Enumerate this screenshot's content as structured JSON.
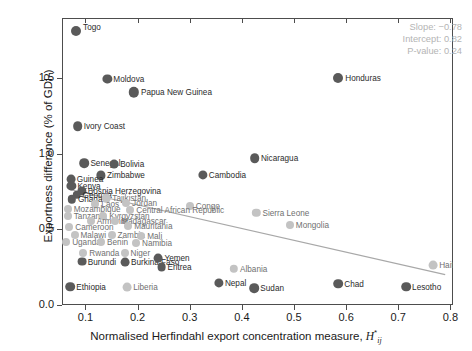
{
  "chart_data": {
    "type": "scatter",
    "title": "",
    "xlabel": "Normalised Herfindahl export concentration measure, H*ij",
    "ylabel": "Exportness difference (% of GDP)",
    "xlim": [
      0.055,
      0.805
    ],
    "ylim": [
      0.0,
      1.9
    ],
    "xticks": [
      "0.1",
      "0.2",
      "0.3",
      "0.4",
      "0.5",
      "0.6",
      "0.7",
      "0.8"
    ],
    "xtick_values": [
      0.1,
      0.2,
      0.3,
      0.4,
      0.5,
      0.6,
      0.7,
      0.8
    ],
    "yticks": [
      "0.0",
      "0.5",
      "1.0",
      "1.5"
    ],
    "ytick_values": [
      0.0,
      0.5,
      1.0,
      1.5
    ],
    "grid": false,
    "legend": "none",
    "annotations": {
      "slope_label": "Slope: −0.78",
      "intercept_label": "Intercept: 0.82",
      "pvalue_label": "P-value: 0.24",
      "slope": -0.78,
      "intercept": 0.82,
      "p_value": 0.24
    },
    "regression_line": {
      "x": [
        0.07,
        0.79
      ],
      "y": [
        0.765,
        0.201
      ],
      "color": "#a8a8a8"
    },
    "marker_colors": {
      "dark": "#5a5a5a",
      "light": "#c3c3c3"
    },
    "points": [
      {
        "label": "Togo",
        "x": 0.082,
        "y": 1.815,
        "tone": "dark",
        "r": 5.0,
        "lx": 7,
        "ly": -4
      },
      {
        "label": "Moldova",
        "x": 0.142,
        "y": 1.498,
        "tone": "dark",
        "r": 4.6,
        "lx": 6,
        "ly": 0
      },
      {
        "label": "Papua New Guinea",
        "x": 0.193,
        "y": 1.408,
        "tone": "dark",
        "r": 5.2,
        "lx": 7,
        "ly": 0
      },
      {
        "label": "Honduras",
        "x": 0.585,
        "y": 1.5,
        "tone": "dark",
        "r": 5.0,
        "lx": 7,
        "ly": 0
      },
      {
        "label": "Ivory Coast",
        "x": 0.085,
        "y": 1.182,
        "tone": "dark",
        "r": 4.8,
        "lx": 6,
        "ly": 0
      },
      {
        "label": "Nicaragua",
        "x": 0.425,
        "y": 0.97,
        "tone": "dark",
        "r": 4.8,
        "lx": 6,
        "ly": 0
      },
      {
        "label": "Senegal",
        "x": 0.098,
        "y": 0.94,
        "tone": "dark",
        "r": 4.8,
        "lx": 6,
        "ly": 0
      },
      {
        "label": "Bolivia",
        "x": 0.155,
        "y": 0.932,
        "tone": "dark",
        "r": 4.4,
        "lx": 6,
        "ly": 0
      },
      {
        "label": "Cambodia",
        "x": 0.325,
        "y": 0.862,
        "tone": "dark",
        "r": 4.6,
        "lx": 6,
        "ly": 0
      },
      {
        "label": "Zimbabwe",
        "x": 0.13,
        "y": 0.858,
        "tone": "dark",
        "r": 4.6,
        "lx": 6,
        "ly": 0
      },
      {
        "label": "Guinea",
        "x": 0.072,
        "y": 0.836,
        "tone": "dark",
        "r": 4.4,
        "lx": 6,
        "ly": 0
      },
      {
        "label": "Kenya",
        "x": 0.073,
        "y": 0.79,
        "tone": "dark",
        "r": 4.6,
        "lx": 6,
        "ly": 0
      },
      {
        "label": "Bosnia Herzegovina",
        "x": 0.093,
        "y": 0.757,
        "tone": "dark",
        "r": 4.6,
        "lx": 6,
        "ly": 0
      },
      {
        "label": "Georgia",
        "x": 0.083,
        "y": 0.728,
        "tone": "dark",
        "r": 4.2,
        "lx": 6,
        "ly": 0
      },
      {
        "label": "Ghana",
        "x": 0.074,
        "y": 0.7,
        "tone": "dark",
        "r": 4.2,
        "lx": 6,
        "ly": 0
      },
      {
        "label": "Tajikistan",
        "x": 0.14,
        "y": 0.706,
        "tone": "light",
        "r": 4.2,
        "lx": 6,
        "ly": 0
      },
      {
        "label": "Laos",
        "x": 0.119,
        "y": 0.669,
        "tone": "light",
        "r": 4.0,
        "lx": 6,
        "ly": 0
      },
      {
        "label": "Jordan",
        "x": 0.178,
        "y": 0.675,
        "tone": "light",
        "r": 4.0,
        "lx": 6,
        "ly": 0
      },
      {
        "label": "Congo",
        "x": 0.3,
        "y": 0.658,
        "tone": "light",
        "r": 4.0,
        "lx": 6,
        "ly": 0
      },
      {
        "label": "Sierra Leone",
        "x": 0.428,
        "y": 0.612,
        "tone": "light",
        "r": 4.2,
        "lx": 6,
        "ly": 0
      },
      {
        "label": "Mozambique",
        "x": 0.066,
        "y": 0.634,
        "tone": "light",
        "r": 4.0,
        "lx": 6,
        "ly": 0
      },
      {
        "label": "Central African Republic",
        "x": 0.186,
        "y": 0.63,
        "tone": "light",
        "r": 4.0,
        "lx": 6,
        "ly": 0
      },
      {
        "label": "Tanzania",
        "x": 0.066,
        "y": 0.588,
        "tone": "light",
        "r": 4.0,
        "lx": 6,
        "ly": 0
      },
      {
        "label": "Kyrgyzstan",
        "x": 0.134,
        "y": 0.591,
        "tone": "light",
        "r": 4.0,
        "lx": 6,
        "ly": 0
      },
      {
        "label": "Armenia",
        "x": 0.11,
        "y": 0.556,
        "tone": "light",
        "r": 4.0,
        "lx": 6,
        "ly": 0
      },
      {
        "label": "Madagascar",
        "x": 0.157,
        "y": 0.556,
        "tone": "light",
        "r": 4.0,
        "lx": 6,
        "ly": 0
      },
      {
        "label": "Mongolia",
        "x": 0.492,
        "y": 0.528,
        "tone": "light",
        "r": 4.0,
        "lx": 6,
        "ly": 0
      },
      {
        "label": "Cameroon",
        "x": 0.069,
        "y": 0.516,
        "tone": "light",
        "r": 4.0,
        "lx": 6,
        "ly": 0
      },
      {
        "label": "Mauritania",
        "x": 0.182,
        "y": 0.52,
        "tone": "light",
        "r": 4.0,
        "lx": 6,
        "ly": 0
      },
      {
        "label": "Malawi",
        "x": 0.079,
        "y": 0.466,
        "tone": "light",
        "r": 4.0,
        "lx": 6,
        "ly": 0
      },
      {
        "label": "Zambia",
        "x": 0.15,
        "y": 0.462,
        "tone": "light",
        "r": 4.0,
        "lx": 6,
        "ly": 0
      },
      {
        "label": "Mali",
        "x": 0.207,
        "y": 0.458,
        "tone": "light",
        "r": 4.0,
        "lx": 6,
        "ly": 0
      },
      {
        "label": "Uganda",
        "x": 0.063,
        "y": 0.42,
        "tone": "light",
        "r": 4.0,
        "lx": 6,
        "ly": 0
      },
      {
        "label": "Benin",
        "x": 0.13,
        "y": 0.416,
        "tone": "light",
        "r": 4.0,
        "lx": 6,
        "ly": 0
      },
      {
        "label": "Namibia",
        "x": 0.197,
        "y": 0.412,
        "tone": "light",
        "r": 4.0,
        "lx": 6,
        "ly": 0
      },
      {
        "label": "Rwanda",
        "x": 0.096,
        "y": 0.347,
        "tone": "light",
        "r": 4.0,
        "lx": 6,
        "ly": 0
      },
      {
        "label": "Niger",
        "x": 0.175,
        "y": 0.345,
        "tone": "light",
        "r": 4.0,
        "lx": 6,
        "ly": 0
      },
      {
        "label": "Burundi",
        "x": 0.093,
        "y": 0.287,
        "tone": "dark",
        "r": 4.4,
        "lx": 6,
        "ly": 0
      },
      {
        "label": "Burkina Faso",
        "x": 0.176,
        "y": 0.283,
        "tone": "dark",
        "r": 4.4,
        "lx": 6,
        "ly": 0
      },
      {
        "label": "Yemen",
        "x": 0.24,
        "y": 0.311,
        "tone": "dark",
        "r": 4.4,
        "lx": 6,
        "ly": 0
      },
      {
        "label": "Eritrea",
        "x": 0.246,
        "y": 0.25,
        "tone": "dark",
        "r": 4.4,
        "lx": 6,
        "ly": 0
      },
      {
        "label": "Albania",
        "x": 0.385,
        "y": 0.24,
        "tone": "light",
        "r": 4.2,
        "lx": 6,
        "ly": 0
      },
      {
        "label": "Haiti",
        "x": 0.767,
        "y": 0.262,
        "tone": "light",
        "r": 4.4,
        "lx": 6,
        "ly": 0
      },
      {
        "label": "Ethiopia",
        "x": 0.071,
        "y": 0.122,
        "tone": "dark",
        "r": 4.8,
        "lx": 6,
        "ly": 0
      },
      {
        "label": "Liberia",
        "x": 0.18,
        "y": 0.12,
        "tone": "light",
        "r": 4.4,
        "lx": 6,
        "ly": 0
      },
      {
        "label": "Nepal",
        "x": 0.356,
        "y": 0.147,
        "tone": "dark",
        "r": 4.6,
        "lx": 6,
        "ly": 0
      },
      {
        "label": "Sudan",
        "x": 0.424,
        "y": 0.113,
        "tone": "dark",
        "r": 4.8,
        "lx": 6,
        "ly": 0
      },
      {
        "label": "Chad",
        "x": 0.585,
        "y": 0.141,
        "tone": "dark",
        "r": 4.8,
        "lx": 6,
        "ly": 0
      },
      {
        "label": "Lesotho",
        "x": 0.715,
        "y": 0.122,
        "tone": "dark",
        "r": 4.8,
        "lx": 6,
        "ly": 0
      }
    ]
  }
}
